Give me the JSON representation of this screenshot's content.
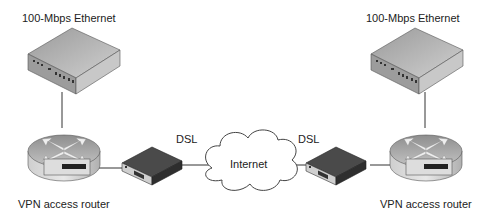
{
  "labels": {
    "left_switch": "100-Mbps Ethernet",
    "right_switch": "100-Mbps Ethernet",
    "left_router": "VPN access router",
    "right_router": "VPN access router",
    "left_link": "DSL",
    "right_link": "DSL",
    "cloud": "Internet"
  },
  "colors": {
    "device_top": "#b8b8b8",
    "device_side": "#8c8c8c",
    "modem_dark": "#4a4a4a",
    "line": "#333333"
  }
}
